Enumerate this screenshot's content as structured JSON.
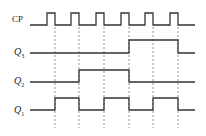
{
  "diagram": {
    "type": "timing-diagram",
    "signals": [
      {
        "name": "CP",
        "label": "CP",
        "sub": "",
        "y_low": 25,
        "y_high": 13,
        "edges": [
          [
            47,
            55
          ],
          [
            71,
            79
          ],
          [
            96,
            104
          ],
          [
            121,
            129
          ],
          [
            145,
            153
          ],
          [
            170,
            178
          ]
        ]
      },
      {
        "name": "Q3",
        "label": "Q",
        "sub": "3",
        "y_low": 53,
        "y_high": 40,
        "edges": [
          [
            129,
            178
          ]
        ]
      },
      {
        "name": "Q2",
        "label": "Q",
        "sub": "2",
        "y_low": 82,
        "y_high": 70,
        "edges": [
          [
            79,
            129
          ]
        ]
      },
      {
        "name": "Q1",
        "label": "Q",
        "sub": "1",
        "y_low": 110,
        "y_high": 98,
        "edges": [
          [
            55,
            79
          ],
          [
            104,
            129
          ],
          [
            153,
            178
          ]
        ]
      }
    ],
    "x_start": 30,
    "x_end": 195,
    "dashed_guides_x": [
      55,
      79,
      104,
      129,
      153,
      178
    ],
    "guide_y": [
      27,
      128
    ],
    "line_color": "#333333",
    "guide_color": "#666666"
  }
}
